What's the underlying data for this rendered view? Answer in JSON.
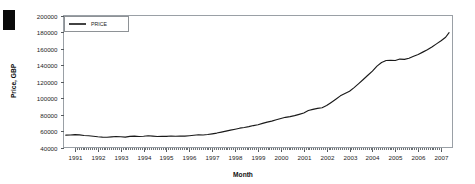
{
  "chart_data": {
    "type": "line",
    "title": "",
    "xlabel": "Month",
    "ylabel": "Price, GBP",
    "legend": [
      "PRICE"
    ],
    "legend_position": "top-left",
    "grid": false,
    "ylim": [
      40000,
      200000
    ],
    "yticks": [
      40000,
      60000,
      80000,
      100000,
      120000,
      140000,
      160000,
      180000,
      200000
    ],
    "ytick_labels": [
      "40000",
      "60000",
      "80000",
      "100000",
      "120000",
      "140000",
      "160000",
      "180000",
      "200000"
    ],
    "xlim": [
      1990.5,
      2007.5
    ],
    "xticks": [
      1991,
      1992,
      1993,
      1994,
      1995,
      1996,
      1997,
      1998,
      1999,
      2000,
      2001,
      2002,
      2003,
      2004,
      2005,
      2006,
      2007
    ],
    "xtick_labels": [
      "1991",
      "1992",
      "1993",
      "1994",
      "1995",
      "1996",
      "1997",
      "1998",
      "1999",
      "2000",
      "2001",
      "2002",
      "2003",
      "2004",
      "2005",
      "2006",
      "2007"
    ],
    "series": [
      {
        "name": "PRICE",
        "color": "#1a1a1a",
        "x": [
          1990.6,
          1990.8,
          1991.0,
          1991.2,
          1991.4,
          1991.6,
          1991.8,
          1992.0,
          1992.2,
          1992.4,
          1992.6,
          1992.8,
          1993.0,
          1993.2,
          1993.4,
          1993.6,
          1993.8,
          1994.0,
          1994.2,
          1994.4,
          1994.6,
          1994.8,
          1995.0,
          1995.2,
          1995.4,
          1995.6,
          1995.8,
          1996.0,
          1996.2,
          1996.4,
          1996.6,
          1996.8,
          1997.0,
          1997.2,
          1997.4,
          1997.6,
          1997.8,
          1998.0,
          1998.2,
          1998.4,
          1998.6,
          1998.8,
          1999.0,
          1999.2,
          1999.4,
          1999.6,
          1999.8,
          2000.0,
          2000.2,
          2000.4,
          2000.6,
          2000.8,
          2001.0,
          2001.2,
          2001.4,
          2001.6,
          2001.8,
          2002.0,
          2002.2,
          2002.4,
          2002.6,
          2002.8,
          2003.0,
          2003.2,
          2003.4,
          2003.6,
          2003.8,
          2004.0,
          2004.2,
          2004.4,
          2004.6,
          2004.8,
          2005.0,
          2005.2,
          2005.4,
          2005.6,
          2005.8,
          2006.0,
          2006.2,
          2006.4,
          2006.6,
          2006.8,
          2007.0,
          2007.2,
          2007.35
        ],
        "y": [
          55000,
          55200,
          55600,
          55300,
          54600,
          54200,
          53600,
          53000,
          52600,
          52400,
          52800,
          53300,
          53000,
          52600,
          53400,
          53800,
          53300,
          53600,
          54200,
          53800,
          53300,
          53700,
          53400,
          53900,
          53600,
          54000,
          53800,
          54300,
          54900,
          55400,
          55200,
          55800,
          56600,
          57500,
          58600,
          59800,
          61000,
          62200,
          63400,
          64200,
          65300,
          66600,
          67600,
          69200,
          70800,
          72000,
          73600,
          75200,
          76600,
          77400,
          78600,
          80200,
          81800,
          84800,
          86200,
          87400,
          88200,
          90800,
          94600,
          98600,
          102600,
          105400,
          108200,
          112600,
          117400,
          122400,
          127600,
          132600,
          138600,
          143000,
          145400,
          145600,
          145400,
          147200,
          146800,
          148200,
          150600,
          152800,
          155600,
          158400,
          161800,
          165600,
          169400,
          173600,
          179200
        ]
      }
    ]
  }
}
